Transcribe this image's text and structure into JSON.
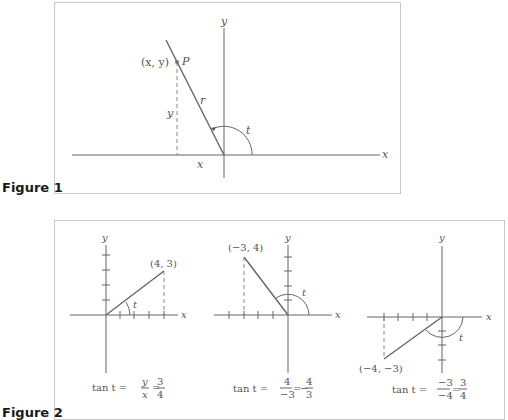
{
  "figure1": {
    "label": "Figure 1",
    "axis_x": "x",
    "axis_y": "y",
    "point_coords": "(x, y)",
    "point_name": "P",
    "radius_label": "r",
    "vertical_label": "y",
    "horizontal_label": "x",
    "angle_label": "t"
  },
  "figure2": {
    "label": "Figure 2",
    "panels": [
      {
        "point_label": "(4, 3)",
        "axis_x": "x",
        "axis_y": "y",
        "angle_label": "t",
        "formula": {
          "prefix": "tan t =",
          "frac1_num": "y",
          "frac1_den": "x",
          "frac2_num": "3",
          "frac2_den": "4",
          "sign": ""
        }
      },
      {
        "point_label": "(−3, 4)",
        "axis_x": "x",
        "axis_y": "y",
        "angle_label": "t",
        "formula": {
          "prefix": "tan t =",
          "frac1_num": "4",
          "frac1_den": "−3",
          "frac2_num": "4",
          "frac2_den": "3",
          "sign": "−"
        }
      },
      {
        "point_label": "(−4, −3)",
        "axis_x": "x",
        "axis_y": "y",
        "angle_label": "t",
        "formula": {
          "prefix": "tan t =",
          "frac1_num": "−3",
          "frac1_den": "−4",
          "frac2_num": "3",
          "frac2_den": "4",
          "sign": ""
        }
      }
    ]
  }
}
